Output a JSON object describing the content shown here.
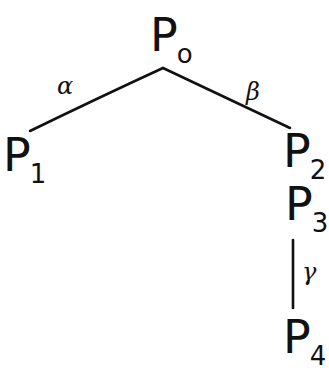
{
  "diagram": {
    "type": "tree",
    "stroke_color": "#111111",
    "background": "#ffffff",
    "nodes": [
      {
        "id": "P0",
        "letter": "P",
        "sub": "o"
      },
      {
        "id": "P1",
        "letter": "P",
        "sub": "1"
      },
      {
        "id": "P2",
        "letter": "P",
        "sub": "2"
      },
      {
        "id": "P3",
        "letter": "P",
        "sub": "3"
      },
      {
        "id": "P4",
        "letter": "P",
        "sub": "4"
      }
    ],
    "edges": [
      {
        "from": "P0",
        "to": "P1",
        "label": "α"
      },
      {
        "from": "P0",
        "to": "P2",
        "label": "β"
      },
      {
        "from": "P3",
        "to": "P4",
        "label": "γ"
      }
    ]
  }
}
